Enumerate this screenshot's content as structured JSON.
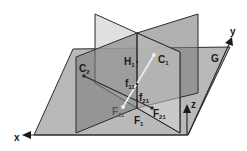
{
  "diagram": {
    "type": "3d-plane-geometry",
    "colors": {
      "background": "#ffffff",
      "ground_plane": "#b9b9b9",
      "plane_light": "#d8d8d8",
      "plane_dark": "#8f8f8f",
      "edge": "#2b2b2b",
      "segment_light": "#f0f0f0"
    },
    "ground_plane_label": "G",
    "axes": {
      "x": "x",
      "y": "y",
      "z": "z"
    },
    "points": {
      "C1": {
        "main": "C",
        "sub": "1"
      },
      "C2": {
        "main": "C",
        "sub": "2"
      },
      "H1": {
        "main": "H",
        "sub": "1"
      },
      "f11": {
        "main": "f",
        "sub": "11"
      },
      "f21": {
        "main": "f",
        "sub": "21"
      },
      "F11": {
        "main": "F",
        "sub": "11"
      },
      "F21": {
        "main": "F",
        "sub": "21"
      },
      "F1": {
        "main": "F",
        "sub": "1"
      }
    }
  }
}
